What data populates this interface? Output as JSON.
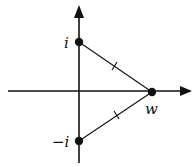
{
  "diagram": {
    "type": "complex-plane",
    "points": [
      {
        "id": "i",
        "label": "i",
        "x": 79,
        "y": 42
      },
      {
        "id": "w",
        "label": "w",
        "x": 152,
        "y": 92
      },
      {
        "id": "neg-i",
        "label": "−i",
        "x": 79,
        "y": 141
      }
    ],
    "segments": [
      {
        "from": "i",
        "to": "w",
        "tick": true
      },
      {
        "from": "neg-i",
        "to": "w",
        "tick": true
      }
    ],
    "axes": {
      "horizontal": {
        "y": 91,
        "x_start": 8,
        "x_end": 192
      },
      "vertical": {
        "x": 79,
        "y_start": 5,
        "y_end": 163
      }
    },
    "colors": {
      "ink": "#111111",
      "background": "#ffffff"
    }
  }
}
